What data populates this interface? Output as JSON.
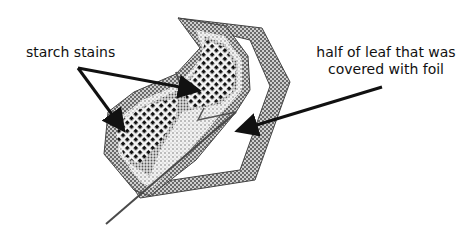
{
  "diagram": {
    "labels": {
      "starch_stains": "starch stains",
      "foil_half_line1": "half of leaf that was",
      "foil_half_line2": "covered with foil"
    },
    "regions": [
      {
        "name": "starch-stained half",
        "pattern": "dense black dots"
      },
      {
        "name": "foil-covered half",
        "pattern": "white interior with hatched border"
      }
    ],
    "colors": {
      "outline": "#4a4a4a",
      "hatch_light": "#bdbdbd",
      "dots": "#111111",
      "arrow": "#111111",
      "background": "#ffffff"
    }
  }
}
